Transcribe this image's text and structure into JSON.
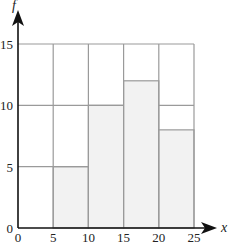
{
  "chart_data": {
    "type": "bar",
    "subtype": "histogram",
    "title": "",
    "xlabel": "x",
    "ylabel": "f",
    "xlim": [
      0,
      25
    ],
    "ylim": [
      0,
      15
    ],
    "x_ticks": [
      0,
      5,
      10,
      15,
      20,
      25
    ],
    "y_ticks": [
      0,
      5,
      10,
      15
    ],
    "grid": true,
    "legend": null,
    "bins": [
      {
        "from": 0,
        "to": 5,
        "value": 0
      },
      {
        "from": 5,
        "to": 10,
        "value": 5
      },
      {
        "from": 10,
        "to": 15,
        "value": 10
      },
      {
        "from": 15,
        "to": 20,
        "value": 12
      },
      {
        "from": 20,
        "to": 25,
        "value": 8
      }
    ],
    "categories": [
      "0-5",
      "5-10",
      "10-15",
      "15-20",
      "20-25"
    ],
    "values": [
      0,
      5,
      10,
      12,
      8
    ],
    "outline_segments": [
      {
        "from": 0,
        "to": 10,
        "y": 5
      },
      {
        "from": 0,
        "to": 15,
        "y": 10
      },
      {
        "from": 20,
        "to": 25,
        "y": 10
      },
      {
        "from": 0,
        "to": 25,
        "y": 15
      }
    ],
    "colors": {
      "fill": "#f2f2f2",
      "grid": "#9a9a9a",
      "axis": "#111111"
    }
  }
}
